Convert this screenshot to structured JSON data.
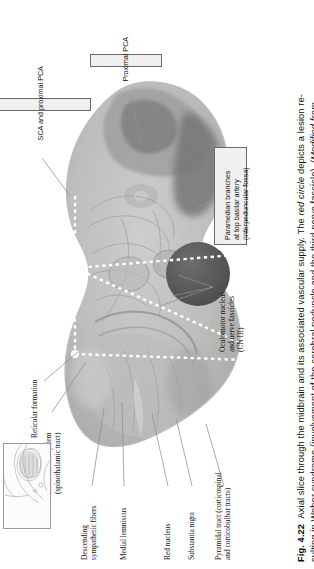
{
  "figure": {
    "number": "Fig. 4.22",
    "caption_line1": "Axial slice through the midbrain and its associated vascular supply. The red circle depicts a lesion re-",
    "caption_line2": "sulting in Weber syndrome (involvement of the cerebral peduncle and the third nerve fascicle). (Modified from",
    "caption_bold": "Fig. 4.22",
    "caption_italic_1": "red circle",
    "caption_italic_2": "(Modified from"
  },
  "vascular_boxes": [
    {
      "id": "sca-proximal-pca",
      "label": "SCA and proximal PCA"
    },
    {
      "id": "proximal-pca",
      "label": "Proximal PCA"
    },
    {
      "id": "paramedian-branches",
      "label_line1": "Paramedian branches",
      "label_line2": "at top basilar artery",
      "label_line3": "(interpeduncular fossa)"
    }
  ],
  "structure_labels": [
    {
      "id": "reticular-formation",
      "line1": "Reticular formation",
      "line2": ""
    },
    {
      "id": "anterolateral-system",
      "line1": "Anterolateral system",
      "line2": "(spinothalamic tract)"
    },
    {
      "id": "oculomotor-nucleus",
      "line1": "Oculomotor nucleus",
      "line2": "and nerve fascicles",
      "line3": "(CN III)"
    },
    {
      "id": "descending-sympathetic-fibers",
      "line1": "Descending",
      "line2": "sympathetic fibers"
    },
    {
      "id": "medial-lemniscus",
      "line1": "Medial lemniscus",
      "line2": ""
    },
    {
      "id": "red-nucleus",
      "line1": "Red nucleus",
      "line2": ""
    },
    {
      "id": "substantia-nigra",
      "line1": "Substantia nigra",
      "line2": ""
    },
    {
      "id": "pyramidal-tract",
      "line1": "Pyramidal tract (corticospinal",
      "line2": "and corticobulbar tracts)"
    }
  ],
  "colors": {
    "lesion_circle": "#5e5e5e",
    "box_fill": "#f0f0f0",
    "box_border": "#6a6a6a",
    "leader": "#8a8a8a",
    "tissue_light": "#c9c9c9",
    "tissue_mid": "#b0b0b0",
    "tissue_dark": "#8f8f8f"
  }
}
